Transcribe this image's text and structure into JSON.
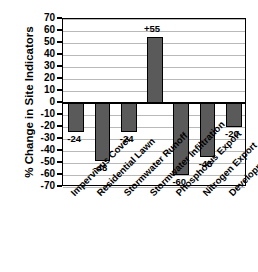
{
  "chart_data": {
    "type": "bar",
    "title": "",
    "xlabel": "",
    "ylabel": "% Change in Site Indicators",
    "ylim": [
      -70,
      70
    ],
    "ytick_step": 10,
    "yticks": [
      70,
      60,
      50,
      40,
      30,
      20,
      10,
      0,
      -10,
      -20,
      -30,
      -40,
      -50,
      -60,
      -70
    ],
    "ytick_labels": [
      "70",
      "60",
      "50",
      "40",
      "30",
      "20",
      "10",
      "0",
      "-10",
      "-20",
      "-30",
      "-40",
      "-50",
      "-60",
      "-70"
    ],
    "grid": true,
    "legend": "none",
    "categories": [
      "Impervious Cover",
      "Residential Lawn",
      "Stormwater Runoff",
      "Stormwater Infiltration",
      "Phosphorus Export",
      "Nitrogen Export",
      "Development Cost"
    ],
    "values": [
      -24,
      -48,
      -24,
      55,
      -60,
      -45,
      -20
    ],
    "data_labels": [
      "-24",
      "-48",
      "-24",
      "+55",
      "-60",
      "-45",
      "-20"
    ],
    "bar_color": "#5a5a5a",
    "bar_edge_color": "#000000",
    "grid_color": "#b9b9b9",
    "axis_color": "#000000"
  }
}
